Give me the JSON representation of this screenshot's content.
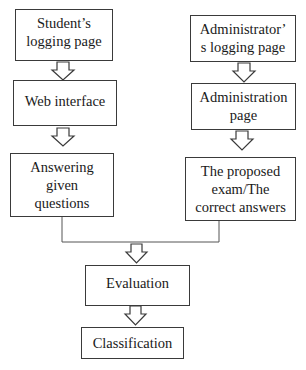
{
  "diagram": {
    "type": "flowchart",
    "nodes": [
      {
        "id": "student_login",
        "label": "Student’s\nlogging page"
      },
      {
        "id": "web_interface",
        "label": "Web interface"
      },
      {
        "id": "answering",
        "label": "Answering\ngiven\nquestions"
      },
      {
        "id": "admin_login",
        "label": "Administrator’\ns logging page"
      },
      {
        "id": "admin_page",
        "label": "Administration\npage"
      },
      {
        "id": "proposed_exam",
        "label": "The proposed\nexam/The\ncorrect answers"
      },
      {
        "id": "evaluation",
        "label": "Evaluation"
      },
      {
        "id": "classification",
        "label": "Classification"
      }
    ],
    "edges": [
      {
        "from": "student_login",
        "to": "web_interface",
        "style": "block-arrow"
      },
      {
        "from": "web_interface",
        "to": "answering",
        "style": "block-arrow"
      },
      {
        "from": "admin_login",
        "to": "admin_page",
        "style": "block-arrow"
      },
      {
        "from": "admin_page",
        "to": "proposed_exam",
        "style": "block-arrow"
      },
      {
        "from": "answering",
        "to": "evaluation",
        "style": "merge-line + block-arrow"
      },
      {
        "from": "proposed_exam",
        "to": "evaluation",
        "style": "merge-line + block-arrow"
      },
      {
        "from": "evaluation",
        "to": "classification",
        "style": "block-arrow"
      }
    ],
    "colors": {
      "stroke": "#3a3a3a",
      "fill": "#ffffff",
      "text": "#1a1a1a"
    }
  }
}
